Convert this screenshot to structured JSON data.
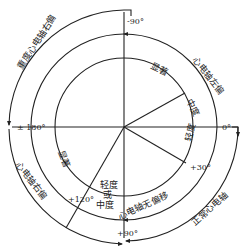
{
  "angles": {
    "top": "-90°",
    "left": "± 180°",
    "right": "0°",
    "bottom": "+90°",
    "plus30": "+30°",
    "plus120": "+120°"
  },
  "outer_arcs": {
    "severe_right": "重度心电轴右偏",
    "left_deviation": "心电轴左偏",
    "normal_axis": "正常心电轴",
    "right_deviation": "心电轴右偏"
  },
  "middle_arcs": {
    "no_deviation": "心电轴无偏移"
  },
  "inner_labels": {
    "marked_top": "显著",
    "moderate": "中度",
    "mild": "轻度",
    "marked_left": "显著",
    "mild_or_moderate_1": "轻度",
    "mild_or_moderate_2": "或",
    "mild_or_moderate_3": "中度"
  },
  "colors": {
    "line": "#222222",
    "background": "#ffffff"
  }
}
